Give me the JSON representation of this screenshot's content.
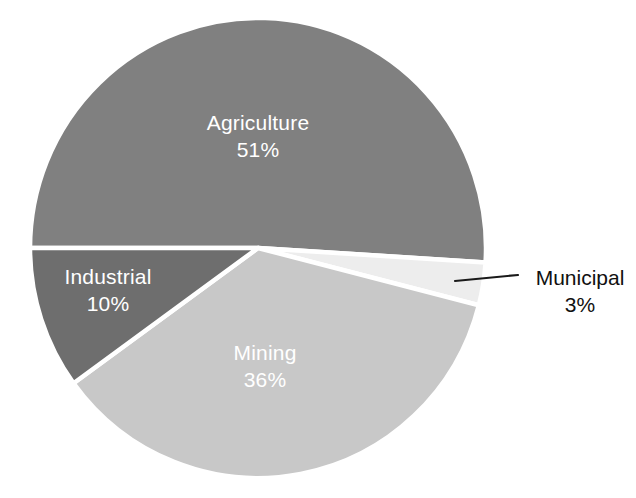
{
  "chart_data": {
    "type": "pie",
    "title": "",
    "subtitle": "",
    "xlabel": "",
    "ylabel": "",
    "legend_position": "none",
    "labels_shown_on_slices": true,
    "categories": [
      "Agriculture",
      "Mining",
      "Industrial",
      "Municipal"
    ],
    "values": [
      51,
      36,
      10,
      3
    ],
    "units": "%",
    "slices": [
      {
        "name": "Agriculture",
        "value": 51,
        "value_label": "51%",
        "color": "#808080",
        "label_color": "#ffffff",
        "label_placement": "inside",
        "start_angle_deg": 180.0,
        "end_angle_deg": 363.6
      },
      {
        "name": "Municipal",
        "value": 3,
        "value_label": "3%",
        "color": "#ededed",
        "label_color": "#111111",
        "label_placement": "outside-callout",
        "start_angle_deg": 363.6,
        "end_angle_deg": 374.4
      },
      {
        "name": "Mining",
        "value": 36,
        "value_label": "36%",
        "color": "#c8c8c8",
        "label_color": "#ffffff",
        "label_placement": "inside",
        "start_angle_deg": 374.4,
        "end_angle_deg": 504.0
      },
      {
        "name": "Industrial",
        "value": 10,
        "value_label": "10%",
        "color": "#6e6e6e",
        "label_color": "#ffffff",
        "label_placement": "inside",
        "start_angle_deg": 504.0,
        "end_angle_deg": 540.0
      }
    ],
    "separator_color": "#ffffff",
    "background_color": "#ffffff",
    "callout": {
      "for": "Municipal",
      "line_color": "#1a1a1a",
      "from_x": 455,
      "from_y": 281,
      "to_x": 518,
      "to_y": 275
    },
    "geometry": {
      "center_x": 258,
      "center_y": 248,
      "radius_x": 228,
      "radius_y": 230
    }
  },
  "labels": {
    "agriculture": {
      "name": "Agriculture",
      "value": "51%"
    },
    "mining": {
      "name": "Mining",
      "value": "36%"
    },
    "industrial": {
      "name": "Industrial",
      "value": "10%"
    },
    "municipal": {
      "name": "Municipal",
      "value": "3%"
    }
  }
}
